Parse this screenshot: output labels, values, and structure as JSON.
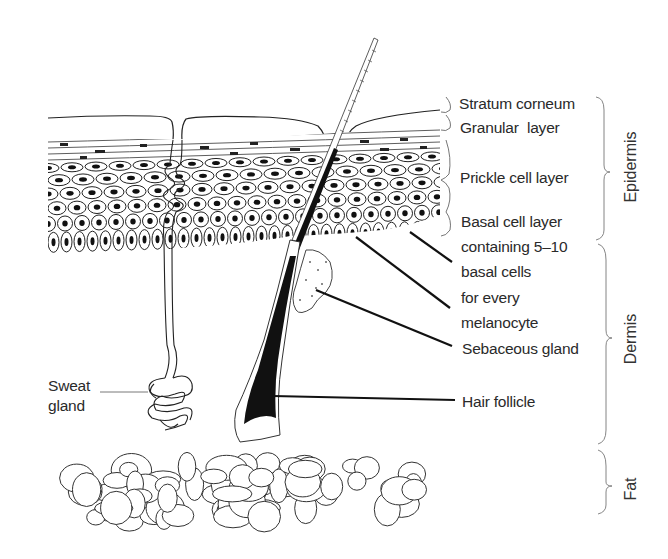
{
  "diagram": {
    "layer_labels": {
      "stratum_corneum": "Stratum corneum",
      "granular_layer": "Granular  layer",
      "prickle_cell_layer": "Prickle cell layer",
      "basal_cell_layer": [
        "Basal cell layer",
        "containing 5–10",
        "basal cells",
        "for every",
        "melanocyte"
      ],
      "sebaceous_gland": "Sebaceous gland",
      "hair_follicle": "Hair follicle",
      "sweat_gland": [
        "Sweat",
        "gland"
      ]
    },
    "region_labels": {
      "epidermis": "Epidermis",
      "dermis": "Dermis",
      "fat": "Fat"
    },
    "colors": {
      "ink": "#1a1a1a",
      "text": "#2a2a2a",
      "background": "#ffffff"
    }
  }
}
